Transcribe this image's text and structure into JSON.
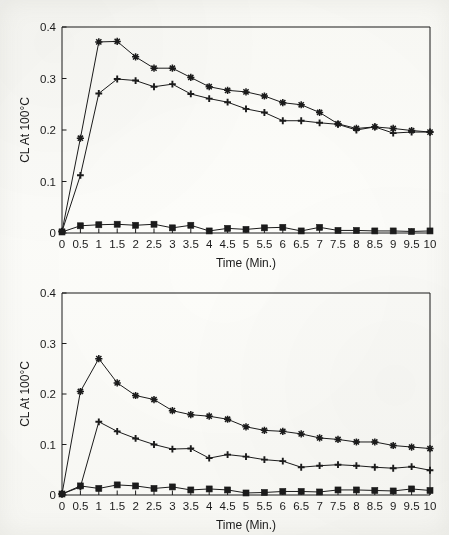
{
  "figure": {
    "background_color": "#fdfdfb",
    "line_color": "#1b1b1b",
    "charts": 2
  },
  "chart_data": [
    {
      "id": "top",
      "type": "line",
      "title": "",
      "xlabel": "Time (Min.)",
      "ylabel": "CL At 100°C",
      "xlim": [
        0,
        10
      ],
      "ylim": [
        0,
        0.4
      ],
      "grid": false,
      "legend_position": "none",
      "xticks": [
        0,
        0.5,
        1,
        1.5,
        2,
        2.5,
        3,
        3.5,
        4,
        4.5,
        5,
        5.5,
        6,
        6.5,
        7,
        7.5,
        8,
        8.5,
        9,
        9.5,
        10
      ],
      "xtick_labels": [
        "0",
        "0.5",
        "1",
        "1.5",
        "2",
        "2.5",
        "3",
        "3.5",
        "4",
        "4.5",
        "5",
        "5.5",
        "6",
        "6.5",
        "7",
        "7.5",
        "8",
        "8.5",
        "9",
        "9.5",
        "10"
      ],
      "yticks": [
        0,
        0.1,
        0.2,
        0.3,
        0.4
      ],
      "ytick_labels": [
        "0",
        "0.1",
        "0.2",
        "0.3",
        "0.4"
      ],
      "x": [
        0,
        0.5,
        1,
        1.5,
        2,
        2.5,
        3,
        3.5,
        4,
        4.5,
        5,
        5.5,
        6,
        6.5,
        7,
        7.5,
        8,
        8.5,
        9,
        9.5,
        10
      ],
      "series": [
        {
          "name": "series-star",
          "marker": "star",
          "values": [
            0.003,
            0.184,
            0.371,
            0.372,
            0.342,
            0.32,
            0.32,
            0.302,
            0.284,
            0.277,
            0.274,
            0.266,
            0.253,
            0.249,
            0.234,
            0.212,
            0.203,
            0.206,
            0.203,
            0.199,
            0.196
          ]
        },
        {
          "name": "series-plus",
          "marker": "plus",
          "values": [
            0.003,
            0.112,
            0.271,
            0.299,
            0.296,
            0.284,
            0.289,
            0.27,
            0.261,
            0.254,
            0.241,
            0.234,
            0.218,
            0.218,
            0.214,
            0.211,
            0.2,
            0.206,
            0.194,
            0.196,
            0.196
          ]
        },
        {
          "name": "series-square",
          "marker": "square",
          "values": [
            0.002,
            0.014,
            0.016,
            0.017,
            0.015,
            0.017,
            0.01,
            0.015,
            0.004,
            0.009,
            0.007,
            0.01,
            0.011,
            0.004,
            0.011,
            0.005,
            0.005,
            0.004,
            0.004,
            0.003,
            0.004
          ]
        }
      ]
    },
    {
      "id": "bottom",
      "type": "line",
      "title": "",
      "xlabel": "Time (Min.)",
      "ylabel": "CL At 100°C",
      "xlim": [
        0,
        10
      ],
      "ylim": [
        0,
        0.4
      ],
      "grid": false,
      "legend_position": "none",
      "xticks": [
        0,
        0.5,
        1,
        1.5,
        2,
        2.5,
        3,
        3.5,
        4,
        4.5,
        5,
        5.5,
        6,
        6.5,
        7,
        7.5,
        8,
        8.5,
        9,
        9.5,
        10
      ],
      "xtick_labels": [
        "0",
        "0.5",
        "1",
        "1.5",
        "2",
        "2.5",
        "3",
        "3.5",
        "4",
        "4.5",
        "5",
        "5.5",
        "6",
        "6.5",
        "7",
        "7.5",
        "8",
        "8.5",
        "9",
        "9.5",
        "10"
      ],
      "yticks": [
        0,
        0.1,
        0.2,
        0.3,
        0.4
      ],
      "ytick_labels": [
        "0",
        "0.1",
        "0.2",
        "0.3",
        "0.4"
      ],
      "x": [
        0,
        0.5,
        1,
        1.5,
        2,
        2.5,
        3,
        3.5,
        4,
        4.5,
        5,
        5.5,
        6,
        6.5,
        7,
        7.5,
        8,
        8.5,
        9,
        9.5,
        10
      ],
      "series": [
        {
          "name": "series-star",
          "marker": "star",
          "values": [
            0.002,
            0.205,
            0.27,
            0.222,
            0.197,
            0.189,
            0.167,
            0.159,
            0.156,
            0.15,
            0.135,
            0.128,
            0.126,
            0.121,
            0.113,
            0.11,
            0.105,
            0.105,
            0.098,
            0.095,
            0.092
          ]
        },
        {
          "name": "series-plus",
          "marker": "plus",
          "values": [
            0.002,
            0.016,
            0.145,
            0.126,
            0.112,
            0.1,
            0.091,
            0.092,
            0.073,
            0.08,
            0.076,
            0.07,
            0.067,
            0.055,
            0.058,
            0.06,
            0.058,
            0.055,
            0.053,
            0.056,
            0.049
          ]
        },
        {
          "name": "series-square",
          "marker": "square",
          "values": [
            0.002,
            0.018,
            0.013,
            0.02,
            0.018,
            0.013,
            0.016,
            0.01,
            0.012,
            0.01,
            0.004,
            0.005,
            0.007,
            0.007,
            0.006,
            0.01,
            0.01,
            0.009,
            0.008,
            0.012,
            0.009
          ]
        }
      ]
    }
  ]
}
